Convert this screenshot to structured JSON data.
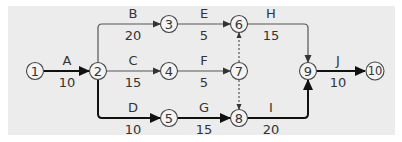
{
  "diagram": {
    "type": "activity-on-arrow network",
    "background_color": "#ececec",
    "nodes": [
      {
        "id": "1",
        "label": "1",
        "x": 35,
        "y": 71
      },
      {
        "id": "2",
        "label": "2",
        "x": 98,
        "y": 71
      },
      {
        "id": "3",
        "label": "3",
        "x": 169,
        "y": 24
      },
      {
        "id": "4",
        "label": "4",
        "x": 169,
        "y": 71
      },
      {
        "id": "5",
        "label": "5",
        "x": 169,
        "y": 118
      },
      {
        "id": "6",
        "label": "6",
        "x": 239,
        "y": 24
      },
      {
        "id": "7",
        "label": "7",
        "x": 239,
        "y": 71
      },
      {
        "id": "8",
        "label": "8",
        "x": 239,
        "y": 118
      },
      {
        "id": "9",
        "label": "9",
        "x": 308,
        "y": 71
      },
      {
        "id": "10",
        "label": "10",
        "x": 375,
        "y": 71
      }
    ],
    "activities": [
      {
        "name": "A",
        "duration": "10",
        "from": "1",
        "to": "2",
        "critical": true
      },
      {
        "name": "B",
        "duration": "20",
        "from": "2",
        "to": "3",
        "critical": false
      },
      {
        "name": "C",
        "duration": "15",
        "from": "2",
        "to": "4",
        "critical": false
      },
      {
        "name": "D",
        "duration": "10",
        "from": "2",
        "to": "5",
        "critical": true
      },
      {
        "name": "E",
        "duration": "5",
        "from": "3",
        "to": "6",
        "critical": false
      },
      {
        "name": "F",
        "duration": "5",
        "from": "4",
        "to": "7",
        "critical": false
      },
      {
        "name": "G",
        "duration": "15",
        "from": "5",
        "to": "8",
        "critical": true
      },
      {
        "name": "H",
        "duration": "15",
        "from": "6",
        "to": "9",
        "critical": false
      },
      {
        "name": "I",
        "duration": "20",
        "from": "8",
        "to": "9",
        "critical": true
      },
      {
        "name": "J",
        "duration": "10",
        "from": "9",
        "to": "10",
        "critical": true
      }
    ],
    "dummies": [
      {
        "from": "7",
        "to": "6"
      },
      {
        "from": "7",
        "to": "8"
      }
    ]
  }
}
